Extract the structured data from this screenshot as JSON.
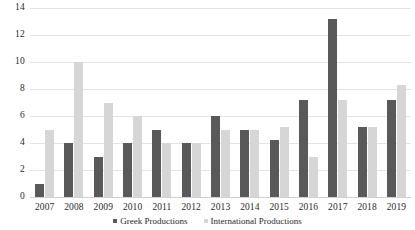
{
  "chart_data": {
    "type": "bar",
    "title": "",
    "xlabel": "",
    "ylabel": "",
    "ylim": [
      0,
      14
    ],
    "yticks": [
      0,
      2,
      4,
      6,
      8,
      10,
      12,
      14
    ],
    "ytick_labels": [
      "0",
      "2",
      "4",
      "6",
      "8",
      "10",
      "12",
      "14"
    ],
    "grid": true,
    "legend_position": "bottom",
    "categories": [
      "2007",
      "2008",
      "2009",
      "2010",
      "2011",
      "2012",
      "2013",
      "2014",
      "2015",
      "2016",
      "2017",
      "2018",
      "2019"
    ],
    "series": [
      {
        "name": "Greek Productions",
        "color": "#595959",
        "values": [
          1,
          4,
          3,
          4,
          5,
          4,
          6,
          5,
          4.2,
          7.2,
          13.2,
          5.2,
          7.2
        ]
      },
      {
        "name": "International Productions",
        "color": "#d6d6d6",
        "values": [
          5,
          10,
          7,
          6,
          4,
          4,
          5,
          5,
          5.2,
          3,
          7.2,
          5.2,
          8.3
        ]
      }
    ]
  },
  "legend": {
    "entries": [
      {
        "label": "Greek Productions"
      },
      {
        "label": "International Productions"
      }
    ]
  }
}
